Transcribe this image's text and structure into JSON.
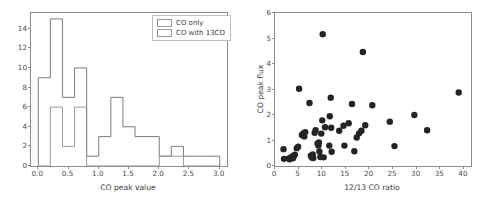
{
  "figure": {
    "panels": [
      "histogram",
      "scatter"
    ]
  },
  "chart_data": [
    {
      "type": "bar",
      "subtype": "histogram",
      "title": "",
      "xlabel": "CO peak value",
      "ylabel": "",
      "xlim": [
        -0.12,
        3.12
      ],
      "ylim": [
        0,
        15.6
      ],
      "xticks": [
        0.0,
        0.5,
        1.0,
        1.5,
        2.0,
        2.5,
        3.0
      ],
      "xtick_labels": [
        "0.0",
        "0.5",
        "1.0",
        "1.5",
        "2.0",
        "2.5",
        "3.0"
      ],
      "yticks": [
        0,
        2,
        4,
        6,
        8,
        10,
        12,
        14
      ],
      "ytick_labels": [
        "0",
        "2",
        "4",
        "6",
        "8",
        "10",
        "12",
        "14"
      ],
      "grid": false,
      "legend_position": "upper right",
      "bin_width": 0.2,
      "series": [
        {
          "name": "CO only",
          "bin_edges": [
            0.0,
            0.2,
            0.4,
            0.6,
            0.8,
            1.0,
            1.2,
            1.4,
            1.6,
            1.8,
            2.0,
            2.2,
            2.4,
            2.6,
            2.8,
            3.0
          ],
          "values": [
            9,
            15,
            7,
            10,
            1,
            3,
            7,
            4,
            3,
            3,
            1,
            2,
            1,
            1,
            1
          ]
        },
        {
          "name": "CO with 13CO",
          "bin_edges": [
            0.0,
            0.2,
            0.4,
            0.6,
            0.8,
            1.0,
            1.2,
            1.4,
            1.6,
            1.8,
            2.0,
            2.2,
            2.4,
            2.6,
            2.8,
            3.0
          ],
          "values": [
            0,
            6,
            2,
            6,
            0,
            0,
            0,
            0,
            0,
            0,
            1,
            1,
            0,
            0,
            0
          ]
        }
      ]
    },
    {
      "type": "scatter",
      "title": "",
      "xlabel": "12/13 CO ratio",
      "ylabel": "CO peak flux",
      "xlim": [
        0,
        41.5
      ],
      "ylim": [
        0,
        6
      ],
      "xticks": [
        0,
        5,
        10,
        15,
        20,
        25,
        30,
        35,
        40
      ],
      "xtick_labels": [
        "0",
        "5",
        "10",
        "15",
        "20",
        "25",
        "30",
        "35",
        "40"
      ],
      "yticks": [
        0,
        1,
        2,
        3,
        4,
        5,
        6
      ],
      "ytick_labels": [
        "0",
        "1",
        "2",
        "3",
        "4",
        "5",
        "6"
      ],
      "grid": false,
      "marker": "circle",
      "marker_color": "#242424",
      "marker_size": 3.2,
      "points": [
        [
          1.8,
          0.66
        ],
        [
          1.9,
          0.28
        ],
        [
          2.9,
          0.3
        ],
        [
          3.1,
          0.26
        ],
        [
          3.4,
          0.33
        ],
        [
          3.6,
          0.36
        ],
        [
          3.8,
          0.3
        ],
        [
          4.0,
          0.4
        ],
        [
          4.2,
          0.44
        ],
        [
          4.6,
          0.7
        ],
        [
          4.9,
          0.76
        ],
        [
          5.1,
          3.03
        ],
        [
          5.7,
          1.22
        ],
        [
          6.0,
          1.28
        ],
        [
          6.2,
          1.16
        ],
        [
          6.4,
          1.33
        ],
        [
          7.3,
          2.47
        ],
        [
          7.6,
          0.4
        ],
        [
          7.8,
          0.33
        ],
        [
          8.0,
          0.45
        ],
        [
          8.1,
          0.31
        ],
        [
          8.4,
          1.3
        ],
        [
          8.6,
          1.4
        ],
        [
          9.0,
          0.88
        ],
        [
          9.2,
          0.8
        ],
        [
          9.3,
          0.92
        ],
        [
          9.4,
          0.57
        ],
        [
          9.6,
          0.35
        ],
        [
          9.8,
          1.27
        ],
        [
          10.0,
          1.79
        ],
        [
          10.1,
          5.17
        ],
        [
          10.3,
          0.34
        ],
        [
          10.6,
          1.52
        ],
        [
          11.5,
          0.8
        ],
        [
          11.6,
          1.95
        ],
        [
          11.8,
          2.68
        ],
        [
          11.9,
          1.5
        ],
        [
          12.0,
          0.56
        ],
        [
          13.6,
          1.38
        ],
        [
          14.5,
          1.58
        ],
        [
          14.7,
          0.8
        ],
        [
          15.6,
          1.68
        ],
        [
          16.3,
          2.43
        ],
        [
          16.8,
          0.58
        ],
        [
          17.3,
          1.12
        ],
        [
          17.8,
          1.28
        ],
        [
          18.3,
          1.38
        ],
        [
          18.6,
          4.47
        ],
        [
          19.1,
          1.6
        ],
        [
          20.6,
          2.38
        ],
        [
          24.3,
          1.74
        ],
        [
          25.3,
          0.78
        ],
        [
          29.5,
          2.0
        ],
        [
          32.2,
          1.4
        ],
        [
          38.9,
          2.88
        ]
      ]
    }
  ],
  "histogram_panel": {
    "legend": {
      "entries": [
        {
          "label": "CO only"
        },
        {
          "label": "CO with 13CO"
        }
      ]
    }
  }
}
